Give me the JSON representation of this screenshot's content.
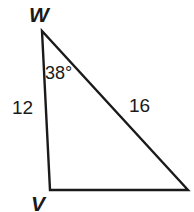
{
  "figure": {
    "kind": "geometry-triangle-diagram",
    "background_color": "#ffffff",
    "stroke_color": "#1a1a1a",
    "text_color": "#1a1a1a"
  },
  "vertices": [
    {
      "id": "W",
      "label": "W",
      "x": 42,
      "y": 31,
      "label_position": "above"
    },
    {
      "id": "V",
      "label": "V",
      "x": 50,
      "y": 190,
      "label_position": "below"
    },
    {
      "id": "U",
      "label": "",
      "x": 188,
      "y": 190,
      "label_position": "none"
    }
  ],
  "sides": [
    {
      "id": "WV",
      "from": "W",
      "to": "V",
      "length_label": "12"
    },
    {
      "id": "WU",
      "from": "W",
      "to": "U",
      "length_label": "16"
    },
    {
      "id": "VU",
      "from": "V",
      "to": "U",
      "length_label": ""
    }
  ],
  "angles": [
    {
      "at": "W",
      "label": "38°",
      "value": 38,
      "unit": "degrees"
    }
  ],
  "labels": {
    "vertex_w": "W",
    "vertex_v": "V",
    "angle_w": "38°",
    "side_wv": "12",
    "side_wu": "16"
  },
  "geometry": {
    "triangle_points": "42,31 50,190 188,190",
    "stroke_width": 2.4
  }
}
